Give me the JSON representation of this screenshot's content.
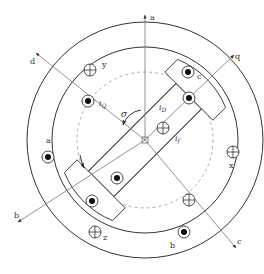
{
  "colors": {
    "line": "#333333",
    "thin_line": "#777777",
    "dashed": "#999999",
    "background": "#ffffff"
  },
  "axes": {
    "a": "a",
    "b": "b",
    "c": "c",
    "d": "d",
    "q": "q"
  },
  "stator_labels": {
    "a": "a",
    "b": "b",
    "c": "c",
    "x": "x",
    "y": "y",
    "z": "z"
  },
  "rotor_labels": {
    "iD": "i",
    "iD_sub": "D",
    "iQ": "i",
    "iQ_sub": "Q",
    "if": "i",
    "if_sub": "f",
    "sigma": "σ"
  },
  "conductors": [
    {
      "id": "stator-a",
      "type": "dot"
    },
    {
      "id": "stator-x",
      "type": "cross"
    },
    {
      "id": "stator-b",
      "type": "dot"
    },
    {
      "id": "stator-y",
      "type": "cross"
    },
    {
      "id": "stator-c",
      "type": "dot"
    },
    {
      "id": "stator-z",
      "type": "cross"
    },
    {
      "id": "rotor-iQ",
      "type": "dot"
    },
    {
      "id": "rotor-iD",
      "type": "cross"
    },
    {
      "id": "rotor-q-outer",
      "type": "dot"
    },
    {
      "id": "rotor-lower-left",
      "type": "dot"
    },
    {
      "id": "rotor-lower-pole",
      "type": "cross"
    },
    {
      "id": "rotor-inner-left",
      "type": "dot"
    }
  ]
}
